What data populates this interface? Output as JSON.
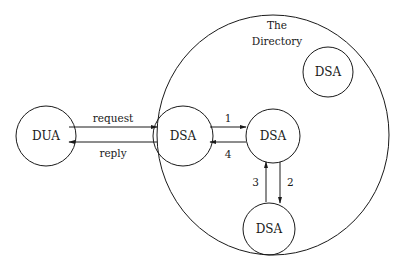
{
  "diagram": {
    "directory": {
      "title_line1": "The",
      "title_line2": "Directory",
      "cx": 273,
      "cy": 135,
      "rx": 116,
      "ry": 120
    },
    "nodes": [
      {
        "id": "dua",
        "label": "DUA",
        "cx": 46,
        "cy": 136,
        "r": 30
      },
      {
        "id": "dsa-entry",
        "label": "DSA",
        "cx": 183,
        "cy": 136,
        "r": 30
      },
      {
        "id": "dsa-middle",
        "label": "DSA",
        "cx": 273,
        "cy": 136,
        "r": 27
      },
      {
        "id": "dsa-bottom",
        "label": "DSA",
        "cx": 269,
        "cy": 229,
        "r": 26
      },
      {
        "id": "dsa-top-right",
        "label": "DSA",
        "cx": 328,
        "cy": 72,
        "r": 25
      }
    ],
    "edges": [
      {
        "id": "request",
        "label": "request",
        "from": "dua",
        "to": "dsa-entry"
      },
      {
        "id": "reply",
        "label": "reply",
        "from": "dsa-entry",
        "to": "dua"
      },
      {
        "id": "step-1",
        "label": "1",
        "from": "dsa-entry",
        "to": "dsa-middle"
      },
      {
        "id": "step-2",
        "label": "2",
        "from": "dsa-middle",
        "to": "dsa-bottom"
      },
      {
        "id": "step-3",
        "label": "3",
        "from": "dsa-bottom",
        "to": "dsa-middle"
      },
      {
        "id": "step-4",
        "label": "4",
        "from": "dsa-middle",
        "to": "dsa-entry"
      }
    ]
  }
}
